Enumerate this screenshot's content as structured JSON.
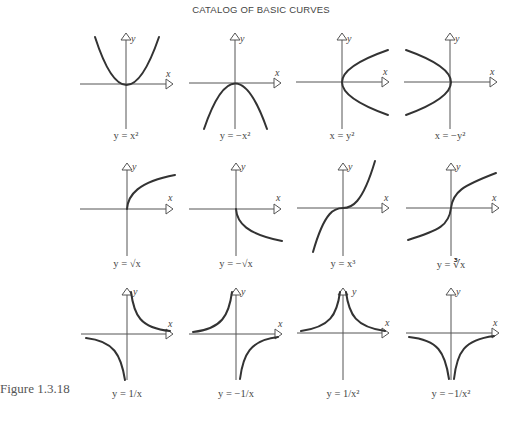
{
  "title": "CATALOG OF BASIC CURVES",
  "figure_label": "Figure 1.3.18",
  "axis_labels": {
    "x": "x",
    "y": "y"
  },
  "panels": [
    {
      "id": "y-eq-x2",
      "label": "y = x²",
      "row": 0,
      "col": 0,
      "shape": "parabola-up"
    },
    {
      "id": "y-eq-neg-x2",
      "label": "y = −x²",
      "row": 0,
      "col": 1,
      "shape": "parabola-down"
    },
    {
      "id": "x-eq-y2",
      "label": "x = y²",
      "row": 0,
      "col": 2,
      "shape": "parabola-right"
    },
    {
      "id": "x-eq-neg-y2",
      "label": "x = −y²",
      "row": 0,
      "col": 3,
      "shape": "parabola-left"
    },
    {
      "id": "y-eq-sqrt-x",
      "label": "y = √x",
      "row": 1,
      "col": 0,
      "shape": "sqrt"
    },
    {
      "id": "y-eq-neg-sqrt-x",
      "label": "y = −√x",
      "row": 1,
      "col": 1,
      "shape": "neg-sqrt"
    },
    {
      "id": "y-eq-x3",
      "label": "y = x³",
      "row": 1,
      "col": 2,
      "shape": "cubic"
    },
    {
      "id": "y-eq-cbrt-x",
      "label": "y = ∛x",
      "row": 1,
      "col": 3,
      "shape": "cube-root"
    },
    {
      "id": "y-eq-1-over-x",
      "label": "y = 1/x",
      "row": 2,
      "col": 0,
      "shape": "reciprocal"
    },
    {
      "id": "y-eq-neg-1-over-x",
      "label": "y = −1/x",
      "row": 2,
      "col": 1,
      "shape": "neg-reciprocal"
    },
    {
      "id": "y-eq-1-over-x2",
      "label": "y = 1/x²",
      "row": 2,
      "col": 2,
      "shape": "inverse-square"
    },
    {
      "id": "y-eq-neg-1-over-x2",
      "label": "y = −1/x²",
      "row": 2,
      "col": 3,
      "shape": "neg-inverse-square"
    }
  ],
  "colors": {
    "curve": "#333333",
    "axis": "#555555",
    "background": "#ffffff"
  }
}
